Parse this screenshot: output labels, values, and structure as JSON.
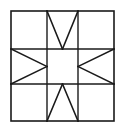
{
  "figure": {
    "name": "quilt-block-diagram",
    "canvas": {
      "width": 124,
      "height": 130,
      "background": "#ffffff"
    }
  },
  "style": {
    "stroke_color": "#1a1a1a",
    "outer_border_width": 1.6,
    "grid_line_width": 1.4,
    "triangle_line_width": 1.6,
    "fill_color": "#ffffff"
  },
  "geometry": {
    "block": {
      "x": 11,
      "y": 11,
      "width": 103,
      "height": 110
    },
    "columns": [
      {
        "index": 0,
        "x": 11,
        "width": 36
      },
      {
        "index": 1,
        "x": 47,
        "width": 31
      },
      {
        "index": 2,
        "x": 78,
        "width": 36
      }
    ],
    "rows": [
      {
        "index": 0,
        "y": 11,
        "height": 38
      },
      {
        "index": 1,
        "y": 49,
        "height": 35
      },
      {
        "index": 2,
        "y": 84,
        "height": 37
      }
    ],
    "grid_lines_vertical": [
      47,
      78
    ],
    "grid_lines_horizontal": [
      49,
      84
    ]
  },
  "cells": [
    {
      "id": "cell-top-left",
      "row": 0,
      "col": 0,
      "content": "plain",
      "label": "plain square"
    },
    {
      "id": "cell-top-center",
      "row": 0,
      "col": 1,
      "content": "triangle-pair-down",
      "label": "V triangles pointing down"
    },
    {
      "id": "cell-top-right",
      "row": 0,
      "col": 2,
      "content": "plain",
      "label": "plain square"
    },
    {
      "id": "cell-middle-left",
      "row": 1,
      "col": 0,
      "content": "triangle-pair-right",
      "label": "triangles pointing right"
    },
    {
      "id": "cell-middle-center",
      "row": 1,
      "col": 1,
      "content": "plain",
      "label": "plain center square"
    },
    {
      "id": "cell-middle-right",
      "row": 1,
      "col": 2,
      "content": "triangle-pair-left",
      "label": "triangles pointing left"
    },
    {
      "id": "cell-bottom-left",
      "row": 2,
      "col": 0,
      "content": "plain",
      "label": "plain square"
    },
    {
      "id": "cell-bottom-center",
      "row": 2,
      "col": 1,
      "content": "triangle-pair-up",
      "label": "triangles pointing up"
    },
    {
      "id": "cell-bottom-right",
      "row": 2,
      "col": 2,
      "content": "plain",
      "label": "plain square"
    }
  ],
  "paths": {
    "outer_border": "M 11 11 L 114 11 L 114 121 L 11 121 Z",
    "grid_v1": "M 47 11 L 47 121",
    "grid_v2": "M 78 11 L 78 121",
    "grid_h1": "M 11 49 L 114 49",
    "grid_h2": "M 11 84 L 114 84",
    "top_center_left_edge": "M 47 11 L 62.5 49",
    "top_center_right_edge": "M 78 11 L 62.5 49",
    "bottom_center_left_edge": "M 47 121 L 62.5 84",
    "bottom_center_right_edge": "M 78 121 L 62.5 84",
    "middle_left_top_edge": "M 11 49 L 47 66.5",
    "middle_left_bottom_edge": "M 11 84 L 47 66.5",
    "middle_right_top_edge": "M 114 49 L 78 66.5",
    "middle_right_bottom_edge": "M 114 84 L 78 66.5"
  }
}
